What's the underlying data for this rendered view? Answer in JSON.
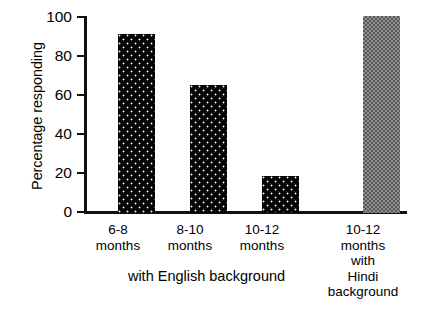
{
  "chart_data": {
    "type": "bar",
    "title": "",
    "xlabel": "",
    "ylabel": "Percentage responding",
    "ylim": [
      0,
      100
    ],
    "yticks": [
      0,
      20,
      40,
      60,
      80,
      100
    ],
    "grid": false,
    "legend": false,
    "categories": [
      "6-8 months",
      "8-10 months",
      "10-12 months",
      "10-12 months with Hindi background"
    ],
    "values": [
      91,
      65,
      19,
      100
    ],
    "bars": [
      {
        "label_lines": [
          "6-8",
          "months"
        ],
        "value": 91,
        "fill": "dark-dotted",
        "color": "#050505"
      },
      {
        "label_lines": [
          "8-10",
          "months"
        ],
        "value": 65,
        "fill": "dark-dotted",
        "color": "#050505"
      },
      {
        "label_lines": [
          "10-12",
          "months"
        ],
        "value": 19,
        "fill": "dark-dotted",
        "color": "#050505"
      },
      {
        "label_lines": [
          "10-12",
          "months",
          "with",
          "Hindi",
          "background"
        ],
        "value": 100,
        "fill": "gray-checker",
        "color": "#8e8e8e"
      }
    ],
    "group_caption": "with English background",
    "annotations": []
  },
  "axis": {
    "y_title": "Percentage responding",
    "tick_labels": [
      "100",
      "80",
      "60",
      "40",
      "20",
      "0"
    ]
  },
  "colors": {
    "axis": "#111111",
    "bar_dark": "#050505",
    "bar_gray": "#8e8e8e",
    "background": "#ffffff"
  }
}
